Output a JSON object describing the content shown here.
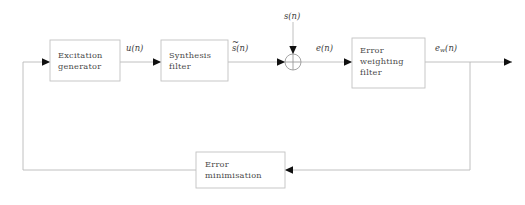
{
  "diagram": {
    "colors": {
      "background": "#ffffff",
      "line": "#b9b9b9",
      "box_border": "#c2c2c2",
      "arrowhead": "#111111",
      "text": "#4a4a4a"
    },
    "blocks": [
      {
        "id": "excitation-generator",
        "label": "Excitation\ngenerator",
        "x": 50,
        "y": 40,
        "width": 70,
        "height": 41
      },
      {
        "id": "synthesis-filter",
        "label": "Synthesis\nfilter",
        "x": 161,
        "y": 40,
        "width": 67,
        "height": 41
      },
      {
        "id": "error-weighting-filter",
        "label": "Error\nweighting\nfilter",
        "x": 352,
        "y": 38,
        "width": 73,
        "height": 50
      },
      {
        "id": "error-minimisation",
        "label": "Error\nminimisation",
        "x": 196,
        "y": 152,
        "width": 89,
        "height": 36
      }
    ],
    "summing_junction": {
      "id": "summing-junction",
      "cx": 293,
      "cy": 62,
      "r": 8
    },
    "signals": [
      {
        "id": "u-n",
        "base": "u",
        "sub": "",
        "arg": "(n)",
        "accent": "",
        "x": 126,
        "y": 43
      },
      {
        "id": "s-tilde-n",
        "base": "s",
        "sub": "",
        "arg": "(n)",
        "accent": "~",
        "x": 232,
        "y": 43
      },
      {
        "id": "s-n",
        "base": "s",
        "sub": "",
        "arg": "(n)",
        "accent": "",
        "x": 284,
        "y": 11
      },
      {
        "id": "e-n",
        "base": "e",
        "sub": "",
        "arg": "(n)",
        "accent": "",
        "x": 316,
        "y": 43
      },
      {
        "id": "ew-n",
        "base": "e",
        "sub": "w",
        "arg": "(n)",
        "accent": "",
        "x": 435,
        "y": 43
      }
    ]
  }
}
